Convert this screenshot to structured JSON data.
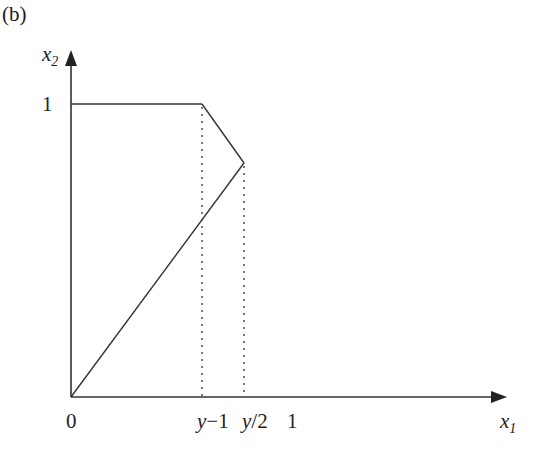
{
  "panel_label": "(b)",
  "axes": {
    "x": {
      "name": "x",
      "subscript": "1"
    },
    "y": {
      "name": "x",
      "subscript": "2"
    }
  },
  "ticks": {
    "x": [
      {
        "label": "0",
        "value": 0
      },
      {
        "label_var": "y",
        "label_rest": "−1",
        "value": "y-1"
      },
      {
        "label_var": "y",
        "label_rest": "/2",
        "value": "y/2"
      },
      {
        "label": "1",
        "value": 1
      }
    ],
    "y": [
      {
        "label": "1",
        "value": 1
      }
    ]
  },
  "region_boundary": {
    "description": "Polygon: (0,0) -> (0,1) -> (y-1,1) -> (y/2,y/2) -> (0,0)",
    "vertices": [
      {
        "x": "0",
        "y": "0"
      },
      {
        "x": "0",
        "y": "1"
      },
      {
        "x": "y-1",
        "y": "1"
      },
      {
        "x": "y/2",
        "y": "y/2"
      }
    ]
  },
  "dashed_guides": [
    {
      "x": "y-1",
      "from_y": "1",
      "to_y": "0"
    },
    {
      "x": "y/2",
      "from_y": "y/2",
      "to_y": "0"
    }
  ],
  "colors": {
    "line": "#333333",
    "dotted": "#555555"
  }
}
